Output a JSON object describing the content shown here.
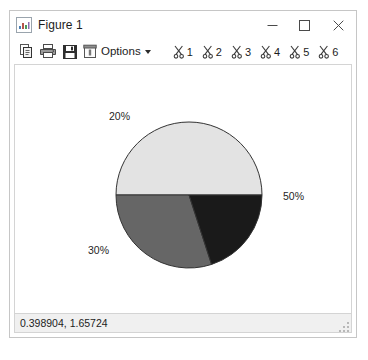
{
  "window": {
    "title": "Figure 1",
    "app_icon": "figure-icon",
    "controls": {
      "minimize": "minimize-icon",
      "maximize": "maximize-icon",
      "close": "close-icon"
    }
  },
  "toolbar": {
    "buttons": [
      {
        "name": "copy-button",
        "icon": "copy-icon",
        "label": "Copy"
      },
      {
        "name": "print-button",
        "icon": "printer-icon",
        "label": "Print"
      },
      {
        "name": "save-button",
        "icon": "save-icon",
        "label": "Save"
      }
    ],
    "options": {
      "label": "Options",
      "icon": "options-icon",
      "caret": "chevron-down-icon"
    },
    "datatips": [
      {
        "label": "1",
        "icon": "scissors-icon"
      },
      {
        "label": "2",
        "icon": "scissors-icon"
      },
      {
        "label": "3",
        "icon": "scissors-icon"
      },
      {
        "label": "4",
        "icon": "scissors-icon"
      },
      {
        "label": "5",
        "icon": "scissors-icon"
      },
      {
        "label": "6",
        "icon": "scissors-icon"
      }
    ]
  },
  "statusbar": {
    "coordinates": "0.398904, 1.65724"
  },
  "chart_data": {
    "type": "pie",
    "title": "",
    "labels": [
      "50%",
      "30%",
      "20%"
    ],
    "values": [
      50,
      30,
      20
    ],
    "slices": [
      {
        "label": "50%",
        "value": 50,
        "color": "#e3e3e3",
        "start_deg": 0,
        "end_deg": 180,
        "label_x": 282,
        "label_y": 189
      },
      {
        "label": "30%",
        "value": 30,
        "color": "#666666",
        "start_deg": 180,
        "end_deg": 288,
        "label_x": 87,
        "label_y": 243
      },
      {
        "label": "20%",
        "value": 20,
        "color": "#1a1a1a",
        "start_deg": 288,
        "end_deg": 360,
        "label_x": 108,
        "label_y": 109
      }
    ],
    "center_x": 188,
    "center_y": 194,
    "radius": 73,
    "edge_color": "#333333",
    "legend": "none",
    "grid": false
  }
}
